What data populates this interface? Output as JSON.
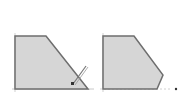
{
  "diagram": {
    "colors": {
      "fill": "#d6d6d6",
      "stroke": "#6e6e6e",
      "axis": "#c8c8c8",
      "pencil": "#555555"
    },
    "left_shape": {
      "points": "15,36 46,36 88,89 15,89"
    },
    "right_shape": {
      "points": "103,36 134,36 163,75 157,89 103,89"
    },
    "left_axis": {
      "x1": 12,
      "y1": 89,
      "x2": 92,
      "y2": 89
    },
    "right_axis": {
      "x1": 100,
      "y1": 89,
      "x2": 170,
      "y2": 89
    },
    "pencil_icon": {
      "name": "pencil-icon"
    },
    "end_marker": {
      "cx": 176,
      "cy": 89
    }
  }
}
